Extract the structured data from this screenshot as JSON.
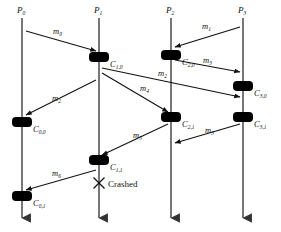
{
  "diagram": {
    "colors": {
      "line": "#555555",
      "arrow": "#111111",
      "checkpoint": "#000000",
      "text": "#111111",
      "background": "#ffffff"
    },
    "processes": [
      {
        "id": "P0",
        "label": "P",
        "sub": "0",
        "x": 22
      },
      {
        "id": "P1",
        "label": "P",
        "sub": "1",
        "x": 99
      },
      {
        "id": "P2",
        "label": "P",
        "sub": "2",
        "x": 171
      },
      {
        "id": "P3",
        "label": "P",
        "sub": "3",
        "x": 243
      }
    ],
    "checkpoints": [
      {
        "id": "C10",
        "label": "C",
        "sub": "1,0",
        "x": 99,
        "y": 57,
        "lx": 110,
        "ly": 60
      },
      {
        "id": "C20",
        "label": "C",
        "sub": "2,0",
        "x": 171,
        "y": 55,
        "lx": 182,
        "ly": 58
      },
      {
        "id": "C30",
        "label": "C",
        "sub": "3,0",
        "x": 243,
        "y": 86,
        "lx": 254,
        "ly": 89
      },
      {
        "id": "C00",
        "label": "C",
        "sub": "0,0",
        "x": 22,
        "y": 122,
        "lx": 33,
        "ly": 125
      },
      {
        "id": "C21",
        "label": "C",
        "sub": "2,1",
        "x": 171,
        "y": 117,
        "lx": 182,
        "ly": 120
      },
      {
        "id": "C31",
        "label": "C",
        "sub": "3,1",
        "x": 243,
        "y": 117,
        "lx": 254,
        "ly": 120
      },
      {
        "id": "C11",
        "label": "C",
        "sub": "1,1",
        "x": 99,
        "y": 160,
        "lx": 110,
        "ly": 163
      },
      {
        "id": "C01",
        "label": "C",
        "sub": "0,1",
        "x": 22,
        "y": 196,
        "lx": 33,
        "ly": 199
      }
    ],
    "messages": [
      {
        "id": "m0",
        "label": "m",
        "sub": "0",
        "x1": 26,
        "y1": 31,
        "x2": 96,
        "y2": 51,
        "lx": 53,
        "ly": 27
      },
      {
        "id": "m1",
        "label": "m",
        "sub": "1",
        "x1": 240,
        "y1": 27,
        "x2": 175,
        "y2": 47,
        "lx": 202,
        "ly": 22
      },
      {
        "id": "m3",
        "label": "m",
        "sub": "3",
        "x1": 175,
        "y1": 60,
        "x2": 240,
        "y2": 72,
        "lx": 203,
        "ly": 56
      },
      {
        "id": "m2",
        "label": "m",
        "sub": "2",
        "x1": 102,
        "y1": 68,
        "x2": 240,
        "y2": 97,
        "lx": 158,
        "ly": 69
      },
      {
        "id": "m4",
        "label": "m",
        "sub": "4",
        "x1": 102,
        "y1": 73,
        "x2": 168,
        "y2": 112,
        "lx": 140,
        "ly": 84
      },
      {
        "id": "m2b",
        "label": "m",
        "sub": "2",
        "x1": 96,
        "y1": 80,
        "x2": 26,
        "y2": 115,
        "lx": 52,
        "ly": 94
      },
      {
        "id": "m5",
        "label": "m",
        "sub": "5",
        "x1": 168,
        "y1": 124,
        "x2": 102,
        "y2": 155,
        "lx": 133,
        "ly": 131
      },
      {
        "id": "m3b",
        "label": "m",
        "sub": "3",
        "x1": 240,
        "y1": 124,
        "x2": 175,
        "y2": 143,
        "lx": 205,
        "ly": 126
      },
      {
        "id": "m6",
        "label": "m",
        "sub": "6",
        "x1": 96,
        "y1": 170,
        "x2": 26,
        "y2": 190,
        "lx": 52,
        "ly": 169
      }
    ],
    "crash": {
      "marker": "x-cross-icon",
      "label": "Crashed",
      "x": 99,
      "y": 183,
      "lx": 108,
      "ly": 180
    },
    "timeline": {
      "top": 18,
      "bottom": 224
    }
  }
}
